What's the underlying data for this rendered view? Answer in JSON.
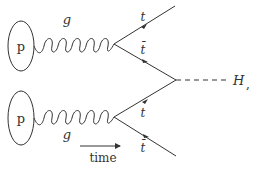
{
  "diagram": {
    "type": "feynman",
    "process": "g g -> t tbar t tbar H (associated Higgs production)",
    "colors": {
      "stroke": "#333333",
      "background": "#ffffff"
    },
    "protons": [
      {
        "label": "p",
        "cx": 21,
        "cy": 46,
        "rx": 13,
        "ry": 25
      },
      {
        "label": "p",
        "cx": 21,
        "cy": 118,
        "rx": 13,
        "ry": 27
      }
    ],
    "gluons": [
      {
        "label": "g",
        "label_pos": "above"
      },
      {
        "label": "g",
        "label_pos": "below"
      }
    ],
    "fermions": {
      "top_t": "t",
      "top_tbar": "t̄",
      "bottom_t": "t",
      "bottom_tbar": "t̄"
    },
    "higgs": {
      "label": "H",
      "trailing": ","
    },
    "time_arrow": {
      "label": "time"
    }
  }
}
